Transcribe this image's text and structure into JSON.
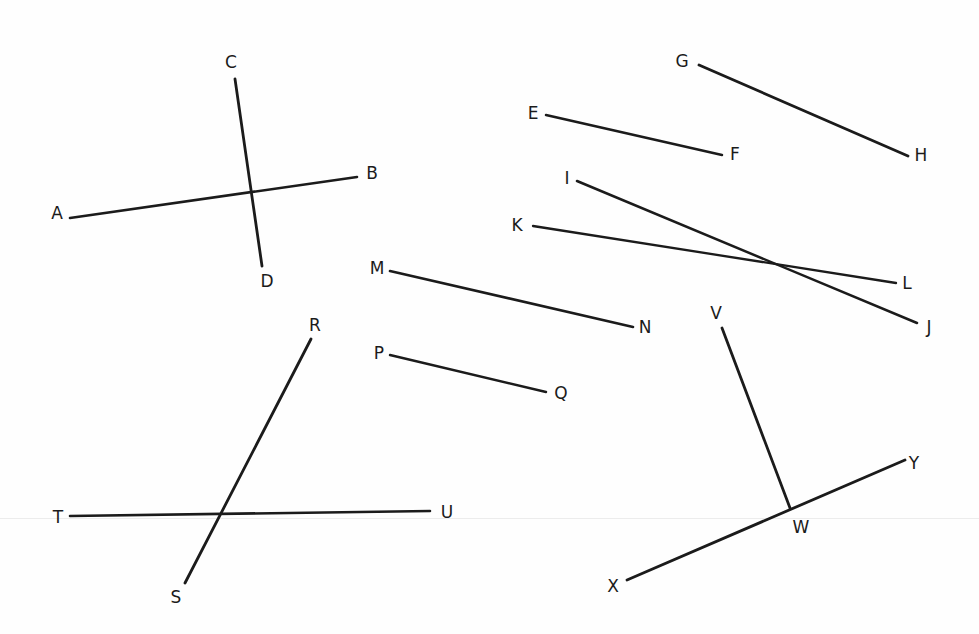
{
  "figure": {
    "type": "line-segment-diagram",
    "width": 979,
    "height": 634,
    "background_color": "#fefefe",
    "stroke_color": "#1b1b1b",
    "label_color": "#1b1b1b",
    "label_font_size": 17,
    "artifact_line_color": "#ececec",
    "artifact_line_y": 518
  },
  "points": [
    {
      "id": "A",
      "label": "A",
      "x": 57,
      "y": 213
    },
    {
      "id": "B",
      "label": "B",
      "x": 372,
      "y": 173
    },
    {
      "id": "C",
      "label": "C",
      "x": 231,
      "y": 62
    },
    {
      "id": "D",
      "label": "D",
      "x": 267,
      "y": 281
    },
    {
      "id": "E",
      "label": "E",
      "x": 533,
      "y": 113
    },
    {
      "id": "F",
      "label": "F",
      "x": 735,
      "y": 154
    },
    {
      "id": "G",
      "label": "G",
      "x": 682,
      "y": 61
    },
    {
      "id": "H",
      "label": "H",
      "x": 921,
      "y": 155
    },
    {
      "id": "I",
      "label": "I",
      "x": 567,
      "y": 178
    },
    {
      "id": "J",
      "label": "J",
      "x": 929,
      "y": 327
    },
    {
      "id": "K",
      "label": "K",
      "x": 517,
      "y": 225
    },
    {
      "id": "L",
      "label": "L",
      "x": 907,
      "y": 283
    },
    {
      "id": "M",
      "label": "M",
      "x": 377,
      "y": 268
    },
    {
      "id": "N",
      "label": "N",
      "x": 645,
      "y": 327
    },
    {
      "id": "P",
      "label": "P",
      "x": 379,
      "y": 353
    },
    {
      "id": "Q",
      "label": "Q",
      "x": 561,
      "y": 393
    },
    {
      "id": "R",
      "label": "R",
      "x": 315,
      "y": 325
    },
    {
      "id": "S",
      "label": "S",
      "x": 176,
      "y": 597
    },
    {
      "id": "T",
      "label": "T",
      "x": 58,
      "y": 517
    },
    {
      "id": "U",
      "label": "U",
      "x": 447,
      "y": 512
    },
    {
      "id": "V",
      "label": "V",
      "x": 716,
      "y": 313
    },
    {
      "id": "W",
      "label": "W",
      "x": 801,
      "y": 527
    },
    {
      "id": "X",
      "label": "X",
      "x": 613,
      "y": 586
    },
    {
      "id": "Y",
      "label": "Y",
      "x": 914,
      "y": 463
    }
  ],
  "segments": [
    {
      "id": "AB",
      "from": "A",
      "to": "B",
      "x1": 70,
      "y1": 218,
      "x2": 357,
      "y2": 177,
      "width": 2.6
    },
    {
      "id": "CD",
      "from": "C",
      "to": "D",
      "x1": 235,
      "y1": 79,
      "x2": 262,
      "y2": 266,
      "width": 2.8
    },
    {
      "id": "EF",
      "from": "E",
      "to": "F",
      "x1": 546,
      "y1": 115,
      "x2": 722,
      "y2": 155,
      "width": 2.5
    },
    {
      "id": "GH",
      "from": "G",
      "to": "H",
      "x1": 699,
      "y1": 65,
      "x2": 908,
      "y2": 156,
      "width": 2.8
    },
    {
      "id": "IJ",
      "from": "I",
      "to": "J",
      "x1": 577,
      "y1": 181,
      "x2": 917,
      "y2": 323,
      "width": 2.5
    },
    {
      "id": "KL",
      "from": "K",
      "to": "L",
      "x1": 533,
      "y1": 226,
      "x2": 896,
      "y2": 283,
      "width": 2.3
    },
    {
      "id": "MN",
      "from": "M",
      "to": "N",
      "x1": 390,
      "y1": 271,
      "x2": 633,
      "y2": 327,
      "width": 2.6
    },
    {
      "id": "PQ",
      "from": "P",
      "to": "Q",
      "x1": 390,
      "y1": 355,
      "x2": 546,
      "y2": 392,
      "width": 2.4
    },
    {
      "id": "RS",
      "from": "R",
      "to": "S",
      "x1": 311,
      "y1": 339,
      "x2": 185,
      "y2": 583,
      "width": 2.8
    },
    {
      "id": "TU",
      "from": "T",
      "to": "U",
      "x1": 70,
      "y1": 516,
      "x2": 430,
      "y2": 511,
      "width": 2.6
    },
    {
      "id": "VW",
      "from": "V",
      "to": "W",
      "x1": 722,
      "y1": 328,
      "x2": 790,
      "y2": 508,
      "width": 2.8
    },
    {
      "id": "XY",
      "from": "X",
      "to": "Y",
      "x1": 627,
      "y1": 580,
      "x2": 905,
      "y2": 460,
      "width": 2.8
    }
  ],
  "intersections": [
    {
      "id": "AB-CD",
      "x": 250,
      "y": 193
    },
    {
      "id": "IJ-KL",
      "x": 768,
      "y": 263
    },
    {
      "id": "RS-TU",
      "x": 216,
      "y": 515
    },
    {
      "id": "VW-XY",
      "x": 790,
      "y": 508
    }
  ]
}
